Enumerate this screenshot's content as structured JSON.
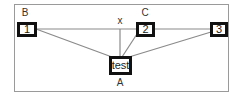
{
  "diagram": {
    "frame_color": "#9a9a9a",
    "line_color": "#8a8a8a",
    "node_border_color": "#111111",
    "nodes": [
      {
        "id": "1",
        "label": "1",
        "group_label": "B"
      },
      {
        "id": "2",
        "label": "2",
        "group_label": "C"
      },
      {
        "id": "3",
        "label": "3"
      },
      {
        "id": "test",
        "label": "test",
        "group_label": "A"
      }
    ],
    "annotations": {
      "x_label": "x"
    },
    "edges": [
      {
        "from": "1",
        "to": "2"
      },
      {
        "from": "2",
        "to": "3"
      },
      {
        "from": "1",
        "to": "test"
      },
      {
        "from": "2",
        "to": "test"
      },
      {
        "from": "3",
        "to": "test"
      },
      {
        "from": "x",
        "to": "test"
      }
    ]
  }
}
